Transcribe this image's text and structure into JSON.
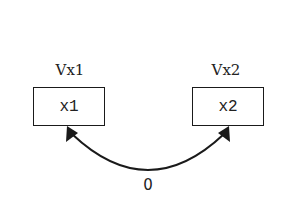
{
  "nodes": [
    {
      "id": "Vx1",
      "title": "Vx1",
      "content": "x1"
    },
    {
      "id": "Vx2",
      "title": "Vx2",
      "content": "x2"
    }
  ],
  "edges": [
    {
      "from": "Vx1",
      "to": "Vx2",
      "label": "0",
      "style": "curved-bidirectional-arrow"
    }
  ],
  "colors": {
    "stroke": "#1a1a1a",
    "background": "#ffffff"
  }
}
